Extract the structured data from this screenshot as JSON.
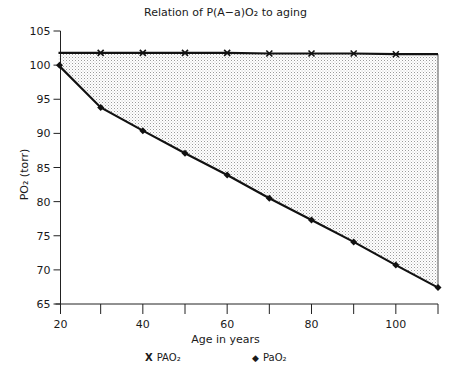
{
  "chart_data": {
    "type": "line",
    "title": "Relation of P(A−a)O₂ to aging",
    "xlabel": "Age in years",
    "ylabel": "PO₂ (torr)",
    "xlim": [
      20,
      110
    ],
    "ylim": [
      65,
      105
    ],
    "x_ticks": [
      20,
      30,
      40,
      50,
      60,
      70,
      80,
      90,
      100,
      110
    ],
    "x_tick_labels": [
      "20",
      "",
      "40",
      "",
      "60",
      "",
      "80",
      "",
      "100",
      ""
    ],
    "y_ticks": [
      65,
      70,
      75,
      80,
      85,
      90,
      95,
      100,
      105
    ],
    "y_tick_labels": [
      "65",
      "70",
      "75",
      "80",
      "85",
      "90",
      "95",
      "100",
      "105"
    ],
    "x": [
      20,
      30,
      40,
      50,
      60,
      70,
      80,
      90,
      100,
      110
    ],
    "series": [
      {
        "name": "PAO₂",
        "marker": "x",
        "values": [
          101.8,
          101.8,
          101.8,
          101.8,
          101.8,
          101.7,
          101.7,
          101.7,
          101.6,
          101.6
        ]
      },
      {
        "name": "PaO₂",
        "marker": "diamond",
        "values": [
          100,
          93.8,
          90.4,
          87.1,
          83.9,
          80.5,
          77.3,
          74.1,
          70.7,
          67.4
        ]
      }
    ],
    "annotations": [
      "Shaded stippled region between PAO₂ and PaO₂ represents the A−a gradient"
    ],
    "grid": false,
    "legend_position": "bottom"
  },
  "labels": {
    "title": "Relation of P(A−a)O₂ to aging",
    "xlabel": "Age in years",
    "ylabel": "PO₂ (torr)",
    "legend_pAO2": "PAO₂",
    "legend_paO2": "PaO₂",
    "legend_x_symbol": "X",
    "legend_diamond_symbol": "◆"
  }
}
